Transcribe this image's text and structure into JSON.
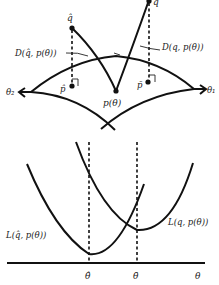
{
  "diagram": {
    "top_panel": {
      "points": {
        "q_hat": "q̂",
        "q": "q",
        "p_hat": "p̂",
        "p_bar": "p̄",
        "p_theta": "p(θ)"
      },
      "distances": {
        "left": "D(q̂, p(θ))",
        "right": "D(q, p(θ))"
      },
      "axes": {
        "theta1": "θ₁",
        "theta2": "θ₂"
      }
    },
    "bottom_panel": {
      "curves": {
        "left": "L(q̂, p(θ))",
        "right": "L(q, p(θ))"
      },
      "x_ticks": {
        "theta_hat": "θ̂",
        "theta_bar": "θ̄",
        "theta": "θ"
      }
    }
  }
}
